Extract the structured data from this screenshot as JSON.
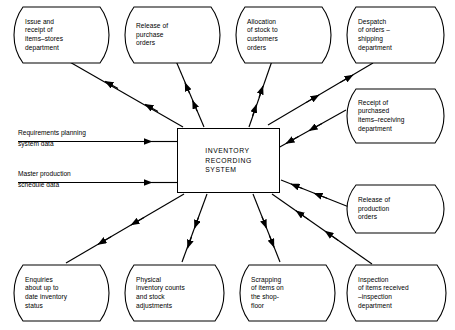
{
  "diagram": {
    "title": "Inventory Recording System",
    "type": "context-data-flow-diagram",
    "line_color": "#000000",
    "background_color": "#ffffff",
    "center": {
      "label": "INVENTORY\nRECORDING\nSYSTEM"
    },
    "nodes": [
      {
        "id": "issue-receipt-items-stores",
        "label": "Issue and\nreceipt of\nitems–stores\ndepartment",
        "position": "top-1",
        "flow_direction": "outbound"
      },
      {
        "id": "release-of-purchase-orders",
        "label": "Release of\npurchase\norders",
        "position": "top-2",
        "flow_direction": "outbound"
      },
      {
        "id": "allocation-of-stock",
        "label": "Allocation\nof stock to\ncustomers\norders",
        "position": "top-3",
        "flow_direction": "outbound"
      },
      {
        "id": "despatch-of-orders",
        "label": "Despatch\nof orders –\nshipping\ndepartment",
        "position": "top-4",
        "flow_direction": "outbound"
      },
      {
        "id": "receipt-of-purchased-items",
        "label": "Receipt of\npurchased\nitems–receiving\ndepartment",
        "position": "right-1",
        "flow_direction": "inbound"
      },
      {
        "id": "release-of-production-orders",
        "label": "Release of\nproduction\norders",
        "position": "right-2",
        "flow_direction": "inbound"
      },
      {
        "id": "enquiries-inventory-status",
        "label": "Enquiries\nabout up to\ndate inventory\nstatus",
        "position": "bottom-1",
        "flow_direction": "outbound"
      },
      {
        "id": "physical-inventory-counts",
        "label": "Physical\ninventory counts\nand stock\nadjustments",
        "position": "bottom-2",
        "flow_direction": "outbound"
      },
      {
        "id": "scrapping-of-items",
        "label": "Scrapping\nof items on\nthe shop-\nfloor",
        "position": "bottom-3",
        "flow_direction": "outbound"
      },
      {
        "id": "inspection-of-items-received",
        "label": "Inspection\nof items received\n–inspection\ndepartment",
        "position": "bottom-4",
        "flow_direction": "inbound"
      }
    ],
    "inputs": [
      {
        "id": "requirements-planning-system-data",
        "line_above": "Requirements planning",
        "line_below": "system data"
      },
      {
        "id": "master-production-schedule-data",
        "line_above": "Master production",
        "line_below": "schedule data"
      }
    ]
  }
}
